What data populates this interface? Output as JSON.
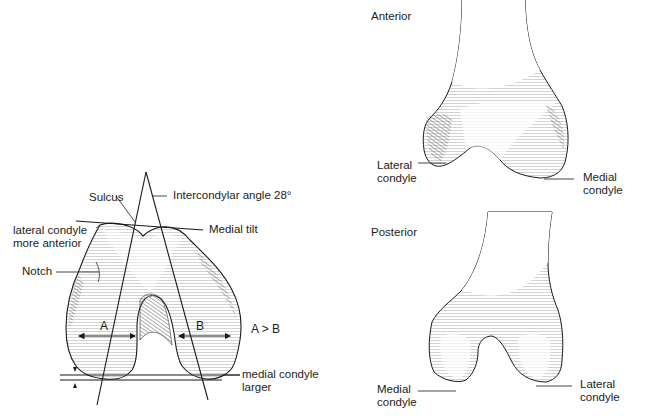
{
  "figure": {
    "left_panel": {
      "view": "axial distal femur",
      "labels": {
        "sulcus": "Sulcus",
        "intercondylar_angle": "Intercondylar angle  28°",
        "medial_tilt": "Medial tilt",
        "lateral_condyle_line1": "lateral condyle",
        "lateral_condyle_line2": "more anterior",
        "notch": "Notch",
        "width_a": "A",
        "width_b": "B",
        "comparison": "A > B",
        "medial_larger_line1": "medial condyle",
        "medial_larger_line2": "larger"
      }
    },
    "anterior_panel": {
      "title": "Anterior",
      "labels": {
        "lateral_line1": "Lateral",
        "lateral_line2": "condyle",
        "medial_line1": "Medial",
        "medial_line2": "condyle"
      }
    },
    "posterior_panel": {
      "title": "Posterior",
      "labels": {
        "medial_line1": "Medial",
        "medial_line2": "condyle",
        "lateral_line1": "Lateral",
        "lateral_line2": "condyle"
      }
    },
    "colors": {
      "ink": "#1a1a1a",
      "bone_fill": "#ffffff",
      "hatch": "#9a9a9a"
    }
  }
}
